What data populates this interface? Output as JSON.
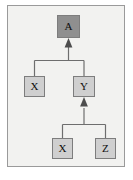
{
  "diagram": {
    "frame": {
      "border_color": "#9a9a9a",
      "background_color": "#f2f2f0"
    },
    "colors": {
      "root_fill": "#8f8f8f",
      "node_fill": "#cfcfcf",
      "node_border": "#7d7d7d",
      "edge": "#6e6e6e",
      "label": "#0d0d0d",
      "page_background": "#ffffff"
    },
    "nodes": [
      {
        "id": "a",
        "label": "A",
        "level": 0,
        "style": "dark",
        "x": 57,
        "y": 15,
        "w": 23,
        "h": 23
      },
      {
        "id": "x1",
        "label": "X",
        "level": 1,
        "style": "light",
        "x": 24,
        "y": 76,
        "w": 21,
        "h": 21
      },
      {
        "id": "y1",
        "label": "Y",
        "level": 1,
        "style": "light",
        "x": 73,
        "y": 76,
        "w": 22,
        "h": 21
      },
      {
        "id": "x2",
        "label": "X",
        "level": 2,
        "style": "light",
        "x": 52,
        "y": 138,
        "w": 21,
        "h": 21
      },
      {
        "id": "z1",
        "label": "Z",
        "level": 2,
        "style": "light",
        "x": 95,
        "y": 138,
        "w": 21,
        "h": 21
      }
    ],
    "edges": [
      {
        "from": "x1",
        "to": "a",
        "arrowhead": "filled-triangle",
        "direction": "up",
        "routing": "orthogonal"
      },
      {
        "from": "y1",
        "to": "a",
        "arrowhead": "filled-triangle",
        "direction": "up",
        "routing": "orthogonal"
      },
      {
        "from": "x2",
        "to": "y1",
        "arrowhead": "filled-triangle",
        "direction": "up",
        "routing": "orthogonal"
      },
      {
        "from": "z1",
        "to": "y1",
        "arrowhead": "filled-triangle",
        "direction": "up",
        "routing": "orthogonal"
      }
    ]
  }
}
